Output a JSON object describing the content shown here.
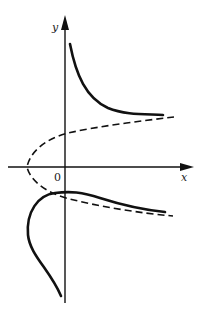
{
  "diagram": {
    "type": "function-curve-sketch",
    "axes": {
      "x_label": "x",
      "y_label": "y",
      "origin_label": "0"
    },
    "curves": [
      {
        "name": "upper-solid-branch",
        "style": "solid"
      },
      {
        "name": "lower-solid-branch",
        "style": "solid"
      },
      {
        "name": "dashed-parabola",
        "style": "dashed"
      }
    ],
    "colors": {
      "stroke": "#111111",
      "background": "#ffffff"
    }
  }
}
